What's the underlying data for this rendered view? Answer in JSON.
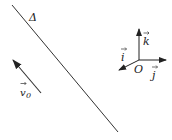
{
  "diagram": {
    "line": {
      "label": "Δ",
      "x1": 12,
      "y1": 5,
      "x2": 118,
      "y2": 132
    },
    "velocity": {
      "label_main": "v",
      "label_sub": "0",
      "tail_x": 41,
      "tail_y": 93,
      "tip_x": 13,
      "tip_y": 60
    },
    "axes": {
      "origin_label": "O",
      "origin": {
        "x": 139,
        "y": 60
      },
      "k": {
        "label": "k",
        "tip_x": 139,
        "tip_y": 28
      },
      "j": {
        "label": "j",
        "tip_x": 166,
        "tip_y": 60
      },
      "i": {
        "label": "i",
        "tip_x": 119,
        "tip_y": 70
      }
    },
    "colors": {
      "stroke": "#333333",
      "background": "#ffffff"
    }
  }
}
